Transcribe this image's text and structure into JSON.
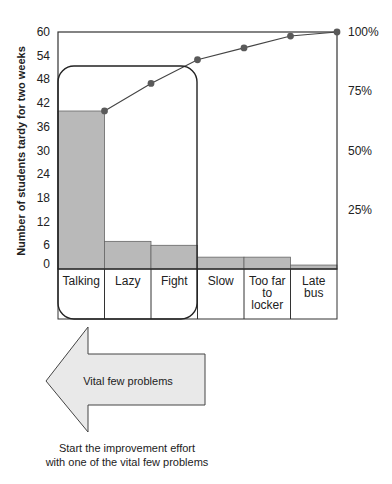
{
  "chart_data": {
    "type": "pareto",
    "title": "",
    "categories": [
      "Talking",
      "Lazy",
      "Fight",
      "Slow",
      "Too far to locker",
      "Late bus"
    ],
    "category_label_lines": [
      [
        "Talking"
      ],
      [
        "Lazy"
      ],
      [
        "Fight"
      ],
      [
        "Slow"
      ],
      [
        "Too far",
        "to",
        "locker"
      ],
      [
        "Late",
        "bus"
      ]
    ],
    "series": [
      {
        "name": "Number of students tardy",
        "type": "bar",
        "axis": "left",
        "values": [
          40,
          7,
          6,
          3,
          3,
          1
        ]
      },
      {
        "name": "Cumulative percent",
        "type": "line",
        "axis": "right",
        "values": [
          66.7,
          78.3,
          88.3,
          93.3,
          98.3,
          100
        ]
      }
    ],
    "ylabel": "Number of students tardy for two weeks",
    "ylim": [
      0,
      60
    ],
    "yticks": [
      0,
      6,
      12,
      18,
      24,
      30,
      36,
      42,
      48,
      54,
      60
    ],
    "y2lim": [
      0,
      100
    ],
    "y2ticks": [
      "25%",
      "50%",
      "75%",
      "100%"
    ],
    "y2tick_values": [
      25,
      50,
      75,
      100
    ],
    "grid": false,
    "highlight_group": [
      "Talking",
      "Lazy",
      "Fight"
    ],
    "colors": {
      "bar": "#b9b9b9",
      "line": "#444444",
      "marker": "#5a5a5a",
      "arrow_fill": "#e9e9e9",
      "frame": "#333333"
    }
  },
  "annotations": {
    "arrow_label": "Vital few problems",
    "caption_line1": "Start the improvement effort",
    "caption_line2": "with one of the vital few problems"
  }
}
